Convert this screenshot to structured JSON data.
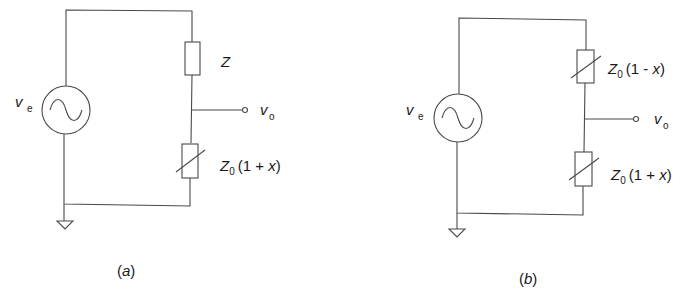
{
  "figure": {
    "panels": [
      {
        "id": "a",
        "caption": "(a)",
        "caption_letter": "a",
        "source": {
          "label": "v",
          "subscript": "e"
        },
        "output": {
          "label": "v",
          "subscript": "o"
        },
        "upper_component": {
          "type": "fixed-impedance",
          "label": "Z"
        },
        "lower_component": {
          "type": "variable-impedance",
          "label_main": "Z",
          "label_sub": "0",
          "label_expr_open": "(1 + ",
          "label_var": "x",
          "label_expr_close": ")"
        }
      },
      {
        "id": "b",
        "caption": "(b)",
        "caption_letter": "b",
        "source": {
          "label": "v",
          "subscript": "e"
        },
        "output": {
          "label": "v",
          "subscript": "o"
        },
        "upper_component": {
          "type": "variable-impedance",
          "label_main": "Z",
          "label_sub": "0",
          "label_expr_open": "(1 - ",
          "label_var": "x",
          "label_expr_close": ")"
        },
        "lower_component": {
          "type": "variable-impedance",
          "label_main": "Z",
          "label_sub": "0",
          "label_expr_open": "(1 + ",
          "label_var": "x",
          "label_expr_close": ")"
        }
      }
    ],
    "colors": {
      "line": "#4a4a4a",
      "text": "#1a1a1a",
      "background": "#ffffff"
    }
  }
}
